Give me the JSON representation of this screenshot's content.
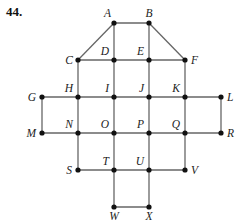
{
  "problem": {
    "number": "44."
  },
  "graph": {
    "vertices": [
      {
        "id": "A",
        "x": 114,
        "y": 23,
        "lx": -3,
        "ly": -6,
        "anchor": "end"
      },
      {
        "id": "B",
        "x": 149,
        "y": 23,
        "lx": 0,
        "ly": -6,
        "anchor": "middle"
      },
      {
        "id": "C",
        "x": 78,
        "y": 60,
        "lx": -5,
        "ly": 4,
        "anchor": "end"
      },
      {
        "id": "D",
        "x": 114,
        "y": 60,
        "lx": -5,
        "ly": -5,
        "anchor": "end"
      },
      {
        "id": "E",
        "x": 149,
        "y": 60,
        "lx": -5,
        "ly": -5,
        "anchor": "end"
      },
      {
        "id": "F",
        "x": 185,
        "y": 60,
        "lx": 6,
        "ly": 4,
        "anchor": "start"
      },
      {
        "id": "G",
        "x": 42,
        "y": 97,
        "lx": -6,
        "ly": 4,
        "anchor": "end"
      },
      {
        "id": "H",
        "x": 78,
        "y": 97,
        "lx": -5,
        "ly": -5,
        "anchor": "end"
      },
      {
        "id": "I",
        "x": 114,
        "y": 97,
        "lx": -5,
        "ly": -5,
        "anchor": "end"
      },
      {
        "id": "J",
        "x": 149,
        "y": 97,
        "lx": -5,
        "ly": -5,
        "anchor": "end"
      },
      {
        "id": "K",
        "x": 185,
        "y": 97,
        "lx": -5,
        "ly": -5,
        "anchor": "end"
      },
      {
        "id": "L",
        "x": 221,
        "y": 97,
        "lx": 6,
        "ly": 4,
        "anchor": "start"
      },
      {
        "id": "M",
        "x": 42,
        "y": 133,
        "lx": -6,
        "ly": 4,
        "anchor": "end"
      },
      {
        "id": "N",
        "x": 78,
        "y": 133,
        "lx": -5,
        "ly": -5,
        "anchor": "end"
      },
      {
        "id": "O",
        "x": 114,
        "y": 133,
        "lx": -5,
        "ly": -5,
        "anchor": "end"
      },
      {
        "id": "P",
        "x": 149,
        "y": 133,
        "lx": -5,
        "ly": -5,
        "anchor": "end"
      },
      {
        "id": "Q",
        "x": 185,
        "y": 133,
        "lx": -5,
        "ly": -5,
        "anchor": "end"
      },
      {
        "id": "R",
        "x": 221,
        "y": 133,
        "lx": 6,
        "ly": 4,
        "anchor": "start"
      },
      {
        "id": "S",
        "x": 78,
        "y": 170,
        "lx": -6,
        "ly": 4,
        "anchor": "end"
      },
      {
        "id": "T",
        "x": 114,
        "y": 170,
        "lx": -5,
        "ly": -5,
        "anchor": "end"
      },
      {
        "id": "U",
        "x": 149,
        "y": 170,
        "lx": -5,
        "ly": -5,
        "anchor": "end"
      },
      {
        "id": "V",
        "x": 185,
        "y": 170,
        "lx": 6,
        "ly": 4,
        "anchor": "start"
      },
      {
        "id": "W",
        "x": 114,
        "y": 207,
        "lx": 0,
        "ly": 13,
        "anchor": "middle"
      },
      {
        "id": "X",
        "x": 149,
        "y": 207,
        "lx": 0,
        "ly": 13,
        "anchor": "middle"
      }
    ],
    "edges": [
      [
        "A",
        "B"
      ],
      [
        "A",
        "C"
      ],
      [
        "B",
        "F"
      ],
      [
        "A",
        "D"
      ],
      [
        "B",
        "E"
      ],
      [
        "C",
        "D"
      ],
      [
        "D",
        "E"
      ],
      [
        "E",
        "F"
      ],
      [
        "C",
        "H"
      ],
      [
        "D",
        "I"
      ],
      [
        "E",
        "J"
      ],
      [
        "F",
        "K"
      ],
      [
        "G",
        "H"
      ],
      [
        "H",
        "I"
      ],
      [
        "I",
        "J"
      ],
      [
        "J",
        "K"
      ],
      [
        "K",
        "L"
      ],
      [
        "G",
        "M"
      ],
      [
        "H",
        "N"
      ],
      [
        "I",
        "O"
      ],
      [
        "J",
        "P"
      ],
      [
        "K",
        "Q"
      ],
      [
        "L",
        "R"
      ],
      [
        "M",
        "N"
      ],
      [
        "N",
        "O"
      ],
      [
        "O",
        "P"
      ],
      [
        "P",
        "Q"
      ],
      [
        "Q",
        "R"
      ],
      [
        "N",
        "S"
      ],
      [
        "O",
        "T"
      ],
      [
        "P",
        "U"
      ],
      [
        "Q",
        "V"
      ],
      [
        "S",
        "T"
      ],
      [
        "T",
        "U"
      ],
      [
        "U",
        "V"
      ],
      [
        "T",
        "W"
      ],
      [
        "U",
        "X"
      ],
      [
        "W",
        "X"
      ]
    ]
  }
}
